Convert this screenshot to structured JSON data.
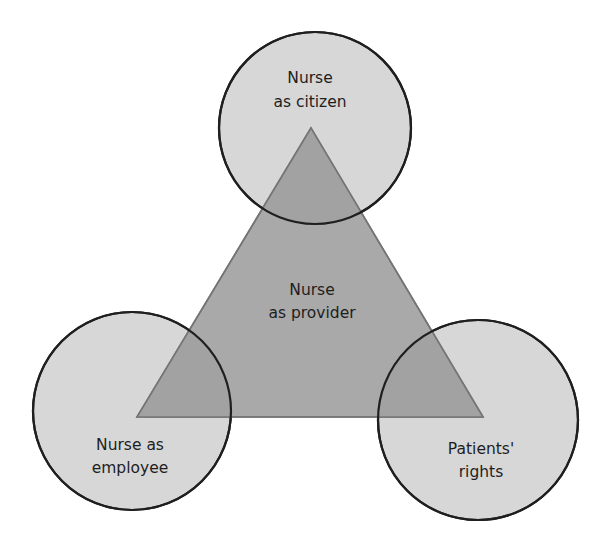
{
  "diagram": {
    "type": "triangle-with-three-circles",
    "colors": {
      "background": "#ffffff",
      "circle_fill": "#d7d7d7",
      "circle_stroke": "#1f1f1f",
      "triangle_fill": "#a9a9a9",
      "triangle_stroke": "#757575",
      "overlap_fill": "#a2a2a2",
      "text": "#1e1e1e"
    },
    "triangle": {
      "label_line1": "Nurse",
      "label_line2": "as provider"
    },
    "circles": [
      {
        "id": "top",
        "label_line1": "Nurse",
        "label_line2": "as citizen"
      },
      {
        "id": "bottom-left",
        "label_line1": "Nurse as",
        "label_line2": "employee"
      },
      {
        "id": "bottom-right",
        "label_line1": "Patients'",
        "label_line2": "rights"
      }
    ]
  }
}
